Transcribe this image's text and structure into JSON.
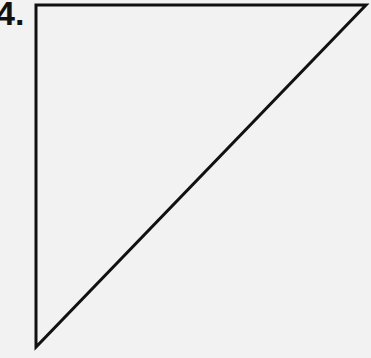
{
  "problem": {
    "number_label": "4."
  },
  "figure": {
    "shape": "right-triangle",
    "stroke_color": "#111111",
    "fill_color": "none",
    "vertices": [
      [
        36,
        5
      ],
      [
        366,
        5
      ],
      [
        36,
        347
      ]
    ]
  }
}
